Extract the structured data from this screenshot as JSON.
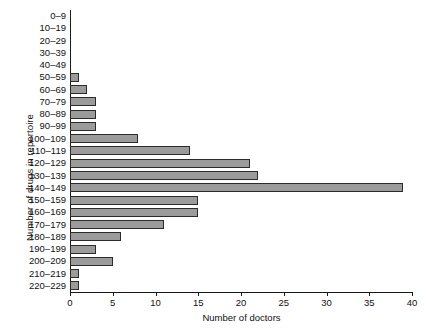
{
  "chart_data": {
    "type": "bar",
    "orientation": "horizontal",
    "title": "",
    "xlabel": "Number of doctors",
    "ylabel": "Number of drugs in repertoire",
    "categories": [
      "0–9",
      "10–19",
      "20–29",
      "30–39",
      "40–49",
      "50–59",
      "60–69",
      "70–79",
      "80–89",
      "90–99",
      "100–109",
      "110–119",
      "120–129",
      "130–139",
      "140–149",
      "150–159",
      "160–169",
      "170–179",
      "180–189",
      "190–199",
      "200–209",
      "210–219",
      "220–229"
    ],
    "values": [
      0,
      0,
      0,
      0,
      0,
      1,
      2,
      3,
      3,
      3,
      8,
      14,
      21,
      22,
      39,
      15,
      15,
      11,
      6,
      3,
      5,
      1,
      1
    ],
    "xlim": [
      0,
      40
    ],
    "xticks": [
      0,
      5,
      10,
      15,
      20,
      25,
      30,
      35,
      40
    ],
    "xtick_labels": [
      "0",
      "5",
      "10",
      "15",
      "20",
      "25",
      "30",
      "35",
      "40"
    ],
    "grid": false,
    "legend": null,
    "bar_color": "#9b9b9b",
    "bar_edge_color": "#2b2b2b",
    "axis_color": "#1a1a1a"
  }
}
